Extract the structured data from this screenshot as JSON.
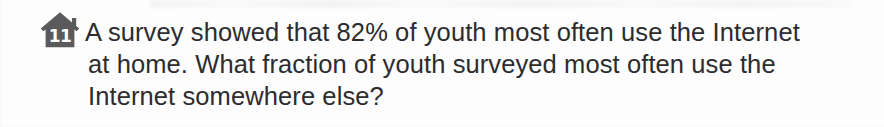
{
  "document": {
    "type": "scanned-textbook-exercise",
    "background_color": "#fdfdfd",
    "text_color": "#2c2c2e"
  },
  "exercise": {
    "number": "11",
    "badge": {
      "icon": "house-icon",
      "shape": "house",
      "fill_color": "#5a5a5c",
      "number_color": "#ffffff"
    },
    "question": {
      "lines": [
        "A survey showed that 82% of youth most often use the Internet",
        "at home. What fraction of youth surveyed most often use the",
        "Internet somewhere else?"
      ],
      "full_text": "A survey showed that 82% of youth most often use the Internet at home. What fraction of youth surveyed most often use the Internet somewhere else?",
      "percent_value": "82%"
    }
  }
}
